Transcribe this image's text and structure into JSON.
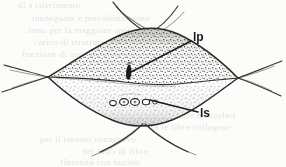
{
  "figure": {
    "domain_kind": "scientific-line-drawing",
    "background_color": "#fcfcfb",
    "ink_color": "#2b2b2b",
    "stipple_color": "#4a4542",
    "labels": [
      {
        "id": "lp",
        "text": "lp",
        "x": 193,
        "y": 31,
        "leader_from_x": 191,
        "leader_from_y": 41,
        "leader_to_x": 131,
        "leader_to_y": 72,
        "points_at": "dark elongated body in upper chamber"
      },
      {
        "id": "ls",
        "text": "ls",
        "x": 200,
        "y": 107,
        "leader_from_x": 198,
        "leader_from_y": 112,
        "leader_to_x": 150,
        "leader_to_y": 100,
        "points_at": "row of small circular bodies in lower chamber"
      }
    ],
    "structures": {
      "upper_chamber": {
        "name": "upper stippled lobe",
        "fill_tone": "dark-stipple"
      },
      "lower_chamber": {
        "name": "lower stippled lobe",
        "fill_tone": "light-stipple"
      },
      "septum": {
        "name": "wavy dividing septum"
      },
      "granules": {
        "name": "row of small circular granules",
        "count": 5,
        "positions": [
          {
            "cx": 113,
            "cy": 103,
            "rx": 3.3,
            "ry": 2.6
          },
          {
            "cx": 124,
            "cy": 102,
            "rx": 4.4,
            "ry": 3.4
          },
          {
            "cx": 135,
            "cy": 102,
            "rx": 4.4,
            "ry": 3.4
          },
          {
            "cx": 146,
            "cy": 102,
            "rx": 3.6,
            "ry": 2.8
          },
          {
            "cx": 155,
            "cy": 102,
            "rx": 2.4,
            "ry": 2.0
          }
        ]
      },
      "dark_inclusion": {
        "name": "dark elongated inclusion",
        "cx": 130,
        "cy": 73
      },
      "left_pole": {
        "name": "left fiber convergence pole",
        "x": 48,
        "y": 77
      },
      "right_pole": {
        "name": "right fiber convergence pole",
        "x": 238,
        "y": 78
      },
      "top_fibers": {
        "name": "upper crossing fiber bundle"
      },
      "bottom_fibers": {
        "name": "lower crossing fiber bundle"
      }
    },
    "bleed_through_text": [
      {
        "text": "di  a  riferimento",
        "x": 18,
        "y": 4
      },
      {
        "text": "inadeguata  e  prevalentemente",
        "x": 32,
        "y": 17
      },
      {
        "text": "sono  per  la  maggiore  specializzata",
        "x": 28,
        "y": 29
      },
      {
        "text": "carico  di  strutture  conoscitive",
        "x": 34,
        "y": 41
      },
      {
        "text": "funzione  di  sostegno",
        "x": 22,
        "y": 53
      },
      {
        "text": "alle  cellule  muscolari",
        "x": 150,
        "y": 112
      },
      {
        "text": "tra  le  fibre  collagene",
        "x": 148,
        "y": 124
      },
      {
        "text": "per  il  tessuto  connettivo",
        "x": 40,
        "y": 136
      },
      {
        "text": "dei  fasci  di  fibre",
        "x": 82,
        "y": 150
      },
      {
        "text": "fibrocita  con  nucleo",
        "x": 60,
        "y": 161
      }
    ]
  }
}
